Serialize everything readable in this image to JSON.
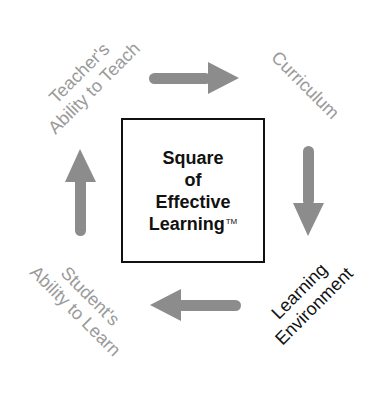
{
  "diagram": {
    "title_lines": [
      "Square",
      "of",
      "Effective",
      "Learning"
    ],
    "trademark": "TM",
    "nodes": [
      {
        "id": "teacher",
        "lines": [
          "Teacher's",
          "Ability to Teach"
        ],
        "color": "#9a9a9a",
        "position": "top-left"
      },
      {
        "id": "curriculum",
        "lines": [
          "Curriculum"
        ],
        "color": "#9a9a9a",
        "position": "top-right"
      },
      {
        "id": "environment",
        "lines": [
          "Learning",
          "Environment"
        ],
        "color": "#111111",
        "position": "bottom-right"
      },
      {
        "id": "student",
        "lines": [
          "Student's",
          "Ability to Learn"
        ],
        "color": "#9a9a9a",
        "position": "bottom-left"
      }
    ],
    "arrows": [
      {
        "from": "teacher",
        "to": "curriculum",
        "direction": "right"
      },
      {
        "from": "curriculum",
        "to": "environment",
        "direction": "down"
      },
      {
        "from": "environment",
        "to": "student",
        "direction": "left"
      },
      {
        "from": "student",
        "to": "teacher",
        "direction": "up"
      }
    ],
    "colors": {
      "arrow": "#8c8c8c",
      "box_border": "#111111",
      "active_label": "#111111",
      "inactive_label": "#9a9a9a"
    }
  }
}
